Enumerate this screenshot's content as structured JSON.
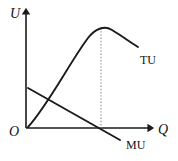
{
  "figure": {
    "kind": "economics-utility-diagram",
    "background_color": "#ffffff",
    "stroke_color": "#1a1a1a",
    "dotted_color": "#8a8a8a",
    "width": 178,
    "height": 161
  },
  "axes": {
    "vertical": {
      "label": "U",
      "meaning": "utility",
      "x": 26,
      "y_top": 12,
      "y_bottom": 128,
      "arrow": "up"
    },
    "horizontal": {
      "label": "Q",
      "meaning": "quantity",
      "y": 128,
      "x_left": 26,
      "x_right": 150,
      "arrow": "right"
    },
    "origin": {
      "label": "O",
      "x": 26,
      "y": 128
    }
  },
  "curves": [
    {
      "name": "total-utility",
      "label": "TU",
      "style": "solid",
      "shape": "inverted-u",
      "path": "M 28 127 C 48 105, 70 62, 88 38 C 95 29, 104 25, 112 30 C 122 36, 130 42, 138 47",
      "label_position": {
        "x": 140,
        "y": 63
      },
      "peak": {
        "x": 101,
        "y": 27
      }
    },
    {
      "name": "marginal-utility",
      "label": "MU",
      "style": "solid",
      "shape": "downward-sloping-line",
      "path": "M 28 88 L 120 140",
      "label_position": {
        "x": 126,
        "y": 148
      },
      "x_intercept": {
        "x": 101,
        "y": 128
      }
    }
  ],
  "guides": [
    {
      "name": "peak-dropline",
      "style": "dotted",
      "from": {
        "x": 101,
        "y": 28
      },
      "to": {
        "x": 101,
        "y": 128
      }
    }
  ],
  "labels": {
    "u_axis": "U",
    "q_axis": "Q",
    "origin": "O",
    "tu_curve": "TU",
    "mu_curve": "MU"
  }
}
